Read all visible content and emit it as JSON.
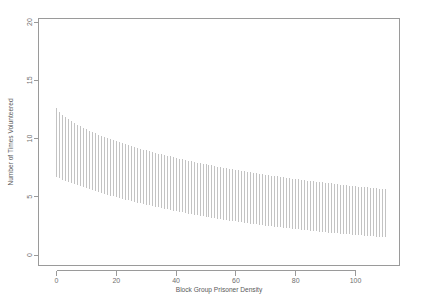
{
  "chart_data": {
    "type": "line",
    "title": "",
    "subtitle": "",
    "xlabel": "Block Group Prisoner Density",
    "ylabel": "Number of Times Volunteered",
    "xlim": [
      -4,
      114
    ],
    "ylim": [
      0,
      21
    ],
    "xticks": [
      0,
      20,
      40,
      60,
      80,
      100
    ],
    "xticklabels": [
      "0",
      "20",
      "40",
      "60",
      "80",
      "100"
    ],
    "yticks": [
      0,
      5,
      10,
      15,
      20
    ],
    "yticklabels": [
      "0",
      "5",
      "10",
      "15",
      "20"
    ],
    "grid": false,
    "legend": null,
    "legend_position": "none",
    "plot_style": "r-base-plot",
    "series": [
      {
        "name": "Upper confidence bound",
        "values": [
          12.6,
          12.3,
          12.06,
          11.85,
          11.66,
          11.49,
          11.33,
          11.18,
          11.04,
          10.91,
          10.78,
          10.66,
          10.55,
          10.44,
          10.33,
          10.23,
          10.13,
          10.03,
          9.94,
          9.85,
          9.76,
          9.67,
          9.59,
          9.51,
          9.43,
          9.35,
          9.27,
          9.2,
          9.12,
          9.05,
          8.98,
          8.91,
          8.84,
          8.77,
          8.71,
          8.64,
          8.58,
          8.52,
          8.46,
          8.4,
          8.34,
          8.28,
          8.22,
          8.16,
          8.11,
          8.05,
          8.0,
          7.94,
          7.89,
          7.84,
          7.79,
          7.74,
          7.69,
          7.64,
          7.59,
          7.54,
          7.49,
          7.45,
          7.4,
          7.36,
          7.31,
          7.27,
          7.22,
          7.18,
          7.14,
          7.1,
          7.05,
          7.01,
          6.97,
          6.93,
          6.89,
          6.86,
          6.82,
          6.78,
          6.74,
          6.7,
          6.67,
          6.63,
          6.6,
          6.56,
          6.53,
          6.49,
          6.46,
          6.42,
          6.39,
          6.36,
          6.32,
          6.29,
          6.26,
          6.23,
          6.2,
          6.17,
          6.14,
          6.11,
          6.08,
          6.05,
          6.02,
          5.99,
          5.96,
          5.93,
          5.91,
          5.88,
          5.85,
          5.82,
          5.8,
          5.77,
          5.75,
          5.72,
          5.69,
          5.67,
          5.64
        ]
      },
      {
        "name": "Lower confidence bound",
        "values": [
          6.7,
          6.58,
          6.47,
          6.37,
          6.27,
          6.17,
          6.08,
          5.99,
          5.9,
          5.81,
          5.73,
          5.64,
          5.56,
          5.48,
          5.4,
          5.32,
          5.25,
          5.17,
          5.1,
          5.03,
          4.96,
          4.89,
          4.82,
          4.75,
          4.68,
          4.62,
          4.56,
          4.49,
          4.43,
          4.37,
          4.31,
          4.25,
          4.19,
          4.14,
          4.08,
          4.02,
          3.97,
          3.92,
          3.86,
          3.81,
          3.76,
          3.71,
          3.66,
          3.61,
          3.56,
          3.51,
          3.47,
          3.42,
          3.37,
          3.33,
          3.29,
          3.24,
          3.2,
          3.16,
          3.12,
          3.07,
          3.03,
          2.99,
          2.95,
          2.92,
          2.88,
          2.84,
          2.8,
          2.77,
          2.73,
          2.7,
          2.66,
          2.63,
          2.59,
          2.56,
          2.53,
          2.49,
          2.46,
          2.43,
          2.4,
          2.37,
          2.34,
          2.31,
          2.28,
          2.25,
          2.22,
          2.19,
          2.17,
          2.14,
          2.11,
          2.08,
          2.06,
          2.03,
          2.01,
          1.98,
          1.96,
          1.93,
          1.91,
          1.88,
          1.86,
          1.84,
          1.81,
          1.79,
          1.77,
          1.75,
          1.72,
          1.7,
          1.68,
          1.66,
          1.64,
          1.62,
          1.6,
          1.58,
          1.56,
          1.54,
          1.52
        ]
      }
    ],
    "x": [
      0,
      1,
      2,
      3,
      4,
      5,
      6,
      7,
      8,
      9,
      10,
      11,
      12,
      13,
      14,
      15,
      16,
      17,
      18,
      19,
      20,
      21,
      22,
      23,
      24,
      25,
      26,
      27,
      28,
      29,
      30,
      31,
      32,
      33,
      34,
      35,
      36,
      37,
      38,
      39,
      40,
      41,
      42,
      43,
      44,
      45,
      46,
      47,
      48,
      49,
      50,
      51,
      52,
      53,
      54,
      55,
      56,
      57,
      58,
      59,
      60,
      61,
      62,
      63,
      64,
      65,
      66,
      67,
      68,
      69,
      70,
      71,
      72,
      73,
      74,
      75,
      76,
      77,
      78,
      79,
      80,
      81,
      82,
      83,
      84,
      85,
      86,
      87,
      88,
      89,
      90,
      91,
      92,
      93,
      94,
      95,
      96,
      97,
      98,
      99,
      100,
      101,
      102,
      103,
      104,
      105,
      106,
      107,
      108,
      109,
      110
    ]
  },
  "colors": {
    "axis": "#9a9a9a",
    "tick_label": "#6f6f6f",
    "axis_title": "#5a5a5a",
    "interval_line": "#b9b9b9",
    "background": "#ffffff"
  }
}
